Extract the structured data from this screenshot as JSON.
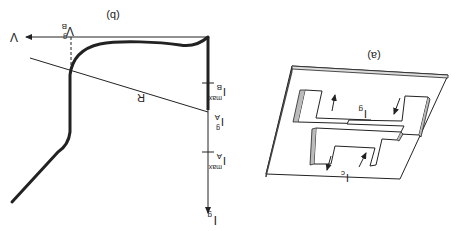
{
  "figure": {
    "orientation": "rotated-180",
    "stroke_color": "#222222",
    "background": "#ffffff"
  },
  "panel_a": {
    "label": "(a)",
    "current_labels": {
      "control": "I",
      "control_sub": "c",
      "gate": "I",
      "gate_sub": "g"
    }
  },
  "panel_b": {
    "label": "(b)",
    "x_axis_label": "V",
    "y_axis_label": "I",
    "y_axis_sub": "g",
    "voltage_marker": {
      "main": "V",
      "sub": "B",
      "sup": "g"
    },
    "load_line_label": "R",
    "current_markers": [
      {
        "main": "I",
        "sub": "A",
        "sup": "g"
      },
      {
        "main": "I",
        "sub": "B",
        "sup": "max"
      },
      {
        "main": "I",
        "sub": "A",
        "sup": "max"
      }
    ]
  }
}
